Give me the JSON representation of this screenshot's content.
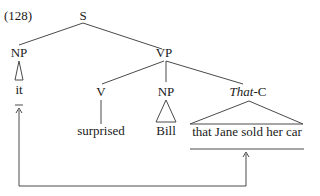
{
  "example_number": "(128)",
  "tree": {
    "root": "S",
    "subject": {
      "label": "NP",
      "leaf": "it"
    },
    "predicate": {
      "label": "VP",
      "verb": {
        "label": "V",
        "leaf": "surprised"
      },
      "object": {
        "label": "NP",
        "leaf": "Bill"
      },
      "complement": {
        "label_italic": "That",
        "label_rest": "-C",
        "leaf": "that Jane sold her car"
      }
    }
  },
  "arrow": {
    "from": "that Jane sold her car",
    "to": "it",
    "description": "extraposition link"
  },
  "colors": {
    "text": "#1a1a1a",
    "lines": "#4a4a4a",
    "background": "#ffffff"
  }
}
